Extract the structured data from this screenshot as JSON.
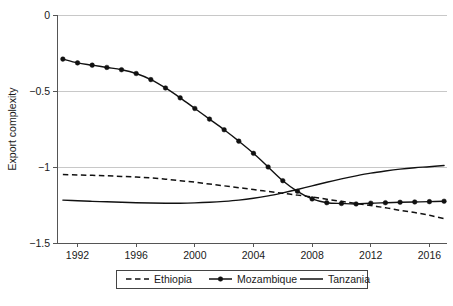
{
  "chart_data": {
    "type": "line",
    "title": "",
    "xlabel": "",
    "ylabel": "Export complexity",
    "xlim": [
      1990.6,
      2017.2
    ],
    "ylim": [
      -1.5,
      0.0
    ],
    "xticks": [
      1992,
      1996,
      2000,
      2004,
      2008,
      2012,
      2016
    ],
    "xtick_labels": [
      "1992",
      "1996",
      "2000",
      "2004",
      "2008",
      "2012",
      "2016"
    ],
    "yticks": [
      0,
      -0.5,
      -1,
      -1.5
    ],
    "ytick_labels": [
      "0",
      "-0.5",
      "-1",
      "-1.5"
    ],
    "grid": "horizontal",
    "legend_position": "bottom",
    "series": [
      {
        "name": "Ethiopia",
        "style": "dashed",
        "marker": "none",
        "color": "#111111",
        "x": [
          1991,
          1992,
          1993,
          1994,
          1995,
          1996,
          1997,
          1998,
          1999,
          2000,
          2001,
          2002,
          2003,
          2004,
          2005,
          2006,
          2007,
          2008,
          2009,
          2010,
          2011,
          2012,
          2013,
          2014,
          2015,
          2016,
          2017
        ],
        "values": [
          -1.05,
          -1.052,
          -1.055,
          -1.058,
          -1.062,
          -1.066,
          -1.072,
          -1.08,
          -1.09,
          -1.1,
          -1.112,
          -1.124,
          -1.136,
          -1.148,
          -1.161,
          -1.173,
          -1.185,
          -1.198,
          -1.212,
          -1.226,
          -1.24,
          -1.254,
          -1.268,
          -1.285,
          -1.3,
          -1.318,
          -1.34
        ]
      },
      {
        "name": "Mozambique",
        "style": "solid",
        "marker": "circle",
        "color": "#111111",
        "x": [
          1991,
          1992,
          1993,
          1994,
          1995,
          1996,
          1997,
          1998,
          1999,
          2000,
          2001,
          2002,
          2003,
          2004,
          2005,
          2006,
          2007,
          2008,
          2009,
          2010,
          2011,
          2012,
          2013,
          2014,
          2015,
          2016,
          2017
        ],
        "values": [
          -0.29,
          -0.315,
          -0.33,
          -0.345,
          -0.36,
          -0.385,
          -0.425,
          -0.48,
          -0.545,
          -0.615,
          -0.685,
          -0.755,
          -0.83,
          -0.91,
          -1.0,
          -1.09,
          -1.16,
          -1.21,
          -1.235,
          -1.24,
          -1.243,
          -1.238,
          -1.235,
          -1.232,
          -1.23,
          -1.228,
          -1.225
        ]
      },
      {
        "name": "Tanzania",
        "style": "solid",
        "marker": "none",
        "color": "#111111",
        "x": [
          1991,
          1992,
          1993,
          1994,
          1995,
          1996,
          1997,
          1998,
          1999,
          2000,
          2001,
          2002,
          2003,
          2004,
          2005,
          2006,
          2007,
          2008,
          2009,
          2010,
          2011,
          2012,
          2013,
          2014,
          2015,
          2016,
          2017
        ],
        "values": [
          -1.218,
          -1.222,
          -1.226,
          -1.229,
          -1.232,
          -1.235,
          -1.237,
          -1.238,
          -1.238,
          -1.236,
          -1.232,
          -1.226,
          -1.218,
          -1.206,
          -1.19,
          -1.17,
          -1.148,
          -1.124,
          -1.1,
          -1.078,
          -1.058,
          -1.04,
          -1.026,
          -1.014,
          -1.005,
          -0.998,
          -0.99
        ]
      }
    ]
  },
  "legend": {
    "items": [
      {
        "label": "Ethiopia",
        "style": "dashed"
      },
      {
        "label": "Mozambique",
        "style": "solid-marker"
      },
      {
        "label": "Tanzania",
        "style": "solid"
      }
    ]
  }
}
